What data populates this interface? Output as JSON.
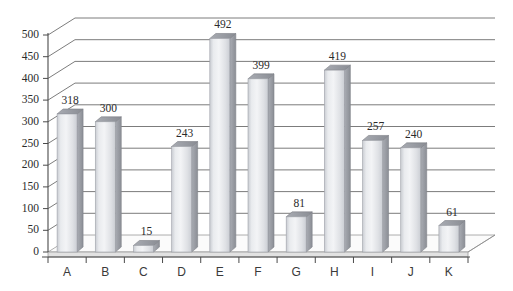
{
  "chart_data": {
    "type": "bar",
    "title": "",
    "subtitle": "",
    "xlabel": "",
    "ylabel": "",
    "categories": [
      "A",
      "B",
      "C",
      "D",
      "E",
      "F",
      "G",
      "H",
      "I",
      "J",
      "K"
    ],
    "values": [
      318,
      300,
      15,
      243,
      492,
      399,
      81,
      419,
      257,
      240,
      61
    ],
    "data_labels": [
      "318",
      "300",
      "15",
      "243",
      "492",
      "399",
      "81",
      "419",
      "257",
      "240",
      "61"
    ],
    "ylim": [
      0,
      500
    ],
    "ytick_step": 50,
    "ytick_labels": [
      "0",
      "50",
      "100",
      "150",
      "200",
      "250",
      "300",
      "350",
      "400",
      "450",
      "500"
    ],
    "ytick_values": [
      0,
      50,
      100,
      150,
      200,
      250,
      300,
      350,
      400,
      450,
      500
    ],
    "grid": true,
    "grid_axis": "y",
    "legend": false,
    "legend_position": "none",
    "style": "3d-perspective",
    "series": [
      {
        "name": "Series 1",
        "values": [
          318,
          300,
          15,
          243,
          492,
          399,
          81,
          419,
          257,
          240,
          61
        ]
      }
    ],
    "colors": {
      "bar_face": "#d3d5da",
      "bar_face_highlight": "#eceef1",
      "bar_side": "#9ea1a8",
      "bar_top": "#8f9299",
      "gridline": "#6d6d6d",
      "axis": "#4a4a4a",
      "text": "#2b2b2b",
      "background": "#ffffff",
      "floor": "#e2e2e2"
    }
  },
  "chart": {
    "alt_description": "3D column chart with eleven categories A through K"
  }
}
